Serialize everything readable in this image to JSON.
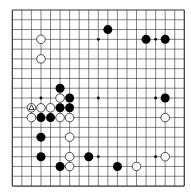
{
  "board": {
    "size": 19,
    "origin_x": 12.3,
    "origin_y": 10,
    "spacing_x": 9.555,
    "spacing_y": 9.78,
    "line_color": "#333333",
    "background": "#ffffff",
    "star_points": [
      [
        3,
        3
      ],
      [
        9,
        3
      ],
      [
        15,
        3
      ],
      [
        3,
        9
      ],
      [
        9,
        9
      ],
      [
        15,
        9
      ],
      [
        3,
        15
      ],
      [
        9,
        15
      ],
      [
        15,
        15
      ]
    ],
    "stones": {
      "black": [
        [
          10,
          2
        ],
        [
          14,
          3
        ],
        [
          16,
          3
        ],
        [
          5,
          8
        ],
        [
          6,
          9
        ],
        [
          5,
          10
        ],
        [
          6,
          10
        ],
        [
          3,
          11
        ],
        [
          4,
          11
        ],
        [
          16,
          9
        ],
        [
          3,
          13
        ],
        [
          3,
          15
        ],
        [
          8,
          15
        ],
        [
          5,
          16
        ],
        [
          11,
          16
        ]
      ],
      "white": [
        [
          3,
          3
        ],
        [
          3,
          5
        ],
        [
          5,
          9
        ],
        [
          2,
          10
        ],
        [
          3,
          10
        ],
        [
          4,
          10
        ],
        [
          5,
          11
        ],
        [
          6,
          11
        ],
        [
          2,
          11
        ],
        [
          6,
          13
        ],
        [
          6,
          15
        ],
        [
          6,
          16
        ],
        [
          16,
          11
        ],
        [
          16,
          15
        ],
        [
          13,
          16
        ]
      ]
    },
    "last_move": {
      "color": "white",
      "point": [
        2,
        10
      ],
      "marker": "triangle"
    }
  }
}
